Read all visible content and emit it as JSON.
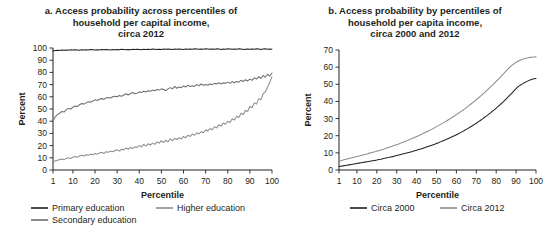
{
  "figure": {
    "panels": [
      {
        "id": "panel-a",
        "title_lines": [
          "a. Access probability across percentiles of",
          "household per capital income,",
          "circa 2012"
        ],
        "xlabel": "Percentile",
        "ylabel": "Percent",
        "legend": [
          {
            "label": "Primary education",
            "color": "#231f20"
          },
          {
            "label": "Higher education",
            "color": "#8d8d8d"
          },
          {
            "label": "Secondary education",
            "color": "#6e6e6e"
          }
        ]
      },
      {
        "id": "panel-b",
        "title_lines": [
          "b. Access probability by percentiles of",
          "household per capita income,",
          "circa 2000 and 2012"
        ],
        "xlabel": "Percentile",
        "ylabel": "Percent",
        "legend": [
          {
            "label": "Circa 2000",
            "color": "#231f20"
          },
          {
            "label": "Circa 2012",
            "color": "#8d8d8d"
          }
        ]
      }
    ]
  },
  "chart_data": [
    {
      "type": "line",
      "id": "panel-a",
      "title": "a. Access probability across percentiles of household per capital income, circa 2012",
      "xlabel": "Percentile",
      "ylabel": "Percent",
      "xlim": [
        1,
        100
      ],
      "ylim": [
        0,
        100
      ],
      "yticks": [
        0,
        10,
        20,
        30,
        40,
        50,
        60,
        70,
        80,
        90,
        100
      ],
      "xticks": [
        1,
        10,
        20,
        30,
        40,
        50,
        60,
        70,
        80,
        90,
        100
      ],
      "grid": false,
      "legend_position": "below",
      "x": [
        1,
        2,
        3,
        4,
        5,
        6,
        7,
        8,
        9,
        10,
        11,
        12,
        13,
        14,
        15,
        16,
        17,
        18,
        19,
        20,
        21,
        22,
        23,
        24,
        25,
        26,
        27,
        28,
        29,
        30,
        31,
        32,
        33,
        34,
        35,
        36,
        37,
        38,
        39,
        40,
        41,
        42,
        43,
        44,
        45,
        46,
        47,
        48,
        49,
        50,
        51,
        52,
        53,
        54,
        55,
        56,
        57,
        58,
        59,
        60,
        61,
        62,
        63,
        64,
        65,
        66,
        67,
        68,
        69,
        70,
        71,
        72,
        73,
        74,
        75,
        76,
        77,
        78,
        79,
        80,
        81,
        82,
        83,
        84,
        85,
        86,
        87,
        88,
        89,
        90,
        91,
        92,
        93,
        94,
        95,
        96,
        97,
        98,
        99,
        100
      ],
      "series": [
        {
          "name": "Primary education",
          "color": "#231f20",
          "values": [
            97.6,
            97.9,
            98.2,
            98.0,
            98.3,
            98.1,
            98.4,
            98.2,
            98.5,
            98.3,
            98.6,
            98.4,
            98.2,
            98.5,
            98.3,
            98.6,
            98.4,
            98.7,
            98.5,
            98.3,
            98.6,
            98.4,
            98.7,
            98.5,
            98.8,
            98.6,
            98.4,
            98.7,
            98.5,
            98.8,
            98.6,
            98.9,
            98.7,
            98.5,
            98.8,
            98.6,
            98.9,
            98.7,
            99.0,
            98.8,
            98.6,
            98.9,
            98.7,
            99.0,
            98.8,
            99.1,
            98.9,
            98.7,
            99.0,
            98.8,
            99.1,
            98.9,
            99.2,
            99.0,
            98.8,
            99.1,
            98.9,
            99.2,
            99.0,
            98.8,
            99.1,
            98.9,
            99.2,
            99.0,
            99.3,
            99.1,
            98.9,
            99.2,
            99.0,
            99.3,
            99.1,
            98.9,
            99.2,
            99.0,
            99.3,
            99.1,
            98.8,
            99.2,
            99.0,
            99.3,
            99.1,
            98.9,
            99.2,
            99.0,
            99.3,
            99.1,
            98.7,
            99.0,
            99.2,
            98.9,
            99.2,
            99.0,
            99.3,
            99.1,
            98.8,
            99.1,
            99.3,
            99.0,
            99.2,
            99.0
          ]
        },
        {
          "name": "Secondary education",
          "color": "#6e6e6e",
          "values": [
            40.5,
            43.5,
            45.5,
            46.5,
            48.0,
            47.5,
            49.5,
            50.5,
            50.0,
            51.5,
            52.5,
            52.0,
            53.5,
            54.5,
            54.0,
            55.0,
            56.0,
            55.5,
            56.5,
            57.5,
            57.0,
            58.0,
            58.5,
            58.0,
            59.0,
            59.5,
            59.0,
            60.0,
            60.5,
            60.0,
            61.0,
            60.5,
            61.5,
            62.5,
            61.5,
            62.5,
            63.5,
            62.5,
            63.0,
            64.0,
            63.5,
            64.5,
            64.0,
            65.0,
            64.5,
            65.5,
            65.0,
            66.0,
            65.5,
            66.5,
            66.0,
            65.0,
            66.5,
            67.5,
            66.5,
            68.5,
            67.0,
            68.0,
            67.5,
            69.0,
            68.0,
            69.5,
            68.5,
            69.0,
            68.5,
            70.0,
            69.0,
            70.5,
            69.5,
            70.0,
            69.5,
            70.5,
            70.0,
            71.0,
            70.5,
            71.5,
            70.5,
            71.5,
            71.0,
            72.0,
            71.0,
            72.5,
            71.5,
            72.5,
            72.0,
            73.5,
            72.5,
            74.0,
            73.0,
            74.5,
            73.5,
            75.5,
            74.5,
            76.5,
            75.0,
            77.5,
            76.0,
            78.5,
            77.0,
            79.5
          ]
        },
        {
          "name": "Higher education",
          "color": "#8d8d8d",
          "values": [
            6.5,
            7.5,
            8.0,
            8.5,
            9.0,
            8.5,
            9.5,
            10.0,
            9.5,
            10.5,
            11.0,
            10.5,
            11.5,
            12.0,
            11.5,
            12.5,
            12.0,
            13.0,
            12.5,
            13.5,
            13.0,
            14.0,
            14.5,
            13.5,
            15.0,
            14.5,
            15.5,
            15.0,
            16.0,
            16.5,
            15.5,
            17.0,
            16.5,
            18.0,
            17.0,
            18.5,
            17.5,
            19.0,
            18.5,
            20.0,
            19.0,
            21.0,
            19.5,
            21.5,
            20.5,
            22.0,
            21.0,
            23.0,
            22.0,
            24.0,
            22.5,
            24.5,
            23.0,
            25.5,
            24.0,
            26.0,
            25.0,
            26.5,
            25.5,
            27.5,
            26.5,
            28.5,
            27.5,
            29.5,
            28.5,
            30.5,
            29.5,
            31.5,
            30.5,
            33.0,
            32.0,
            34.0,
            33.0,
            35.5,
            34.5,
            37.0,
            36.0,
            38.5,
            37.5,
            40.0,
            39.0,
            42.0,
            41.0,
            44.0,
            43.0,
            46.5,
            45.5,
            49.0,
            48.0,
            52.0,
            51.0,
            55.0,
            54.0,
            58.5,
            57.5,
            62.5,
            64.0,
            68.0,
            72.0,
            76.5
          ]
        }
      ]
    },
    {
      "type": "line",
      "id": "panel-b",
      "title": "b. Access probability by percentiles of household per capita income, circa 2000 and 2012",
      "xlabel": "Percentile",
      "ylabel": "Percent",
      "xlim": [
        1,
        100
      ],
      "ylim": [
        0,
        70
      ],
      "yticks": [
        0,
        10,
        20,
        30,
        40,
        50,
        60,
        70
      ],
      "xticks": [
        1,
        10,
        20,
        30,
        40,
        50,
        60,
        70,
        80,
        90,
        100
      ],
      "grid": false,
      "legend_position": "below",
      "x": [
        1,
        2,
        3,
        4,
        5,
        6,
        7,
        8,
        9,
        10,
        11,
        12,
        13,
        14,
        15,
        16,
        17,
        18,
        19,
        20,
        21,
        22,
        23,
        24,
        25,
        26,
        27,
        28,
        29,
        30,
        31,
        32,
        33,
        34,
        35,
        36,
        37,
        38,
        39,
        40,
        41,
        42,
        43,
        44,
        45,
        46,
        47,
        48,
        49,
        50,
        51,
        52,
        53,
        54,
        55,
        56,
        57,
        58,
        59,
        60,
        61,
        62,
        63,
        64,
        65,
        66,
        67,
        68,
        69,
        70,
        71,
        72,
        73,
        74,
        75,
        76,
        77,
        78,
        79,
        80,
        81,
        82,
        83,
        84,
        85,
        86,
        87,
        88,
        89,
        90,
        91,
        92,
        93,
        94,
        95,
        96,
        97,
        98,
        99,
        100
      ],
      "series": [
        {
          "name": "Circa 2000",
          "color": "#231f20",
          "values": [
            2.0,
            2.2,
            2.4,
            2.6,
            2.8,
            3.0,
            3.2,
            3.4,
            3.6,
            3.8,
            4.0,
            4.2,
            4.4,
            4.6,
            4.8,
            5.0,
            5.2,
            5.4,
            5.6,
            5.8,
            6.1,
            6.3,
            6.6,
            6.8,
            7.1,
            7.3,
            7.6,
            7.8,
            8.1,
            8.4,
            8.7,
            9.0,
            9.3,
            9.6,
            9.9,
            10.2,
            10.5,
            10.8,
            11.2,
            11.5,
            11.9,
            12.2,
            12.6,
            13.0,
            13.4,
            13.8,
            14.2,
            14.6,
            15.0,
            15.5,
            15.9,
            16.4,
            16.9,
            17.4,
            17.9,
            18.4,
            18.9,
            19.5,
            20.0,
            20.6,
            21.2,
            21.8,
            22.4,
            23.0,
            23.7,
            24.4,
            25.1,
            25.8,
            26.6,
            27.3,
            28.1,
            28.9,
            29.7,
            30.6,
            31.4,
            32.3,
            33.2,
            34.2,
            35.1,
            36.1,
            37.1,
            38.2,
            39.2,
            40.3,
            41.5,
            42.6,
            43.8,
            45.0,
            46.3,
            47.5,
            48.6,
            49.4,
            50.1,
            50.8,
            51.4,
            52.0,
            52.5,
            52.9,
            53.2,
            53.4
          ]
        },
        {
          "name": "Circa 2012",
          "color": "#8d8d8d",
          "values": [
            5.0,
            5.4,
            5.8,
            6.1,
            6.4,
            6.7,
            7.0,
            7.3,
            7.6,
            7.9,
            8.2,
            8.5,
            8.8,
            9.1,
            9.4,
            9.7,
            10.0,
            10.3,
            10.6,
            11.0,
            11.3,
            11.7,
            12.0,
            12.4,
            12.8,
            13.2,
            13.6,
            14.0,
            14.4,
            14.8,
            15.2,
            15.7,
            16.1,
            16.6,
            17.0,
            17.5,
            18.0,
            18.5,
            19.0,
            19.5,
            20.0,
            20.6,
            21.1,
            21.7,
            22.3,
            22.8,
            23.4,
            24.0,
            24.6,
            25.3,
            25.9,
            26.6,
            27.2,
            27.9,
            28.6,
            29.3,
            30.0,
            30.8,
            31.5,
            32.3,
            33.1,
            33.9,
            34.7,
            35.5,
            36.4,
            37.3,
            38.2,
            39.1,
            40.0,
            41.0,
            42.0,
            43.0,
            44.0,
            45.0,
            46.1,
            47.2,
            48.3,
            49.4,
            50.5,
            51.7,
            52.9,
            54.1,
            55.3,
            56.5,
            57.8,
            59.0,
            60.2,
            61.2,
            62.0,
            62.8,
            63.4,
            64.0,
            64.5,
            64.9,
            65.2,
            65.5,
            65.7,
            65.8,
            65.9,
            66.0
          ]
        }
      ]
    }
  ]
}
